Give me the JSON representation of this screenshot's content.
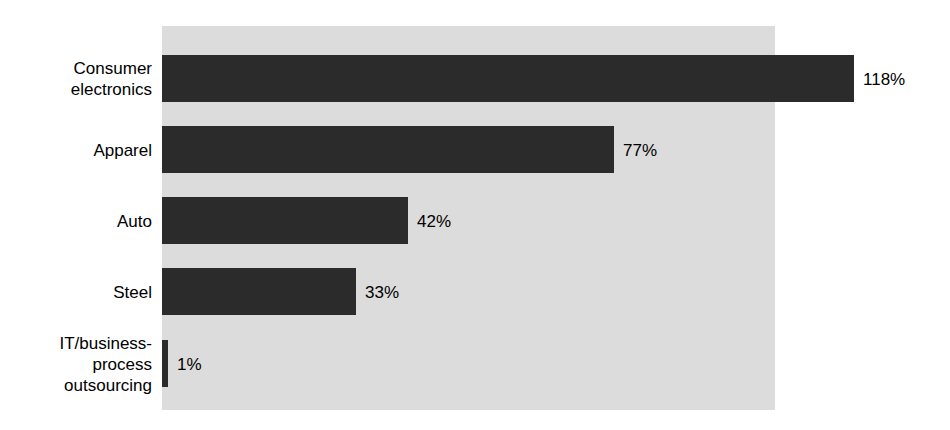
{
  "chart_data": {
    "type": "bar",
    "orientation": "horizontal",
    "title": "",
    "subtitle": "",
    "xlabel": "",
    "ylabel": "",
    "grid": false,
    "legend": false,
    "legend_position": "none",
    "axis_visible": false,
    "tick_labels": [],
    "xlim": [
      0,
      118
    ],
    "value_suffix": "%",
    "categories": [
      "Consumer electronics",
      "Apparel",
      "Auto",
      "Steel",
      "IT/business-process outsourcing"
    ],
    "values": [
      118,
      77,
      42,
      33,
      1
    ],
    "value_labels": [
      "118%",
      "77%",
      "42%",
      "33%",
      "1%"
    ],
    "colors": {
      "bar": "#2b2b2b",
      "plot_background": "#dcdcdc",
      "page_background": "#ffffff",
      "text": "#000000"
    },
    "points": [
      {
        "category": "Consumer electronics",
        "label_lines": "Consumer\nelectronics",
        "value": 118,
        "value_label": "118%"
      },
      {
        "category": "Apparel",
        "label_lines": "Apparel",
        "value": 77,
        "value_label": "77%"
      },
      {
        "category": "Auto",
        "label_lines": "Auto",
        "value": 42,
        "value_label": "42%"
      },
      {
        "category": "Steel",
        "label_lines": "Steel",
        "value": 33,
        "value_label": "33%"
      },
      {
        "category": "IT/business-process outsourcing",
        "label_lines": "IT/business-\nprocess\noutsourcing",
        "value": 1,
        "value_label": "1%"
      }
    ]
  }
}
